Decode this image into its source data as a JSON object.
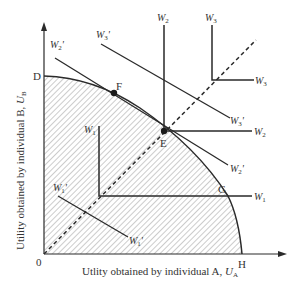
{
  "diagram": {
    "axes": {
      "x_label": "Utlity obtained by individual A, ",
      "x_symbol": "U",
      "x_symbol_sub": "A",
      "y_label": "Utility obtained by individual B, ",
      "y_symbol": "U",
      "y_symbol_sub": "B",
      "origin": "0"
    },
    "points": {
      "D": "D",
      "F": "F",
      "E": "E",
      "G": "G",
      "H": "H"
    },
    "curves": {
      "rawlsian": [
        {
          "id": "W1",
          "label": "W",
          "sub": "1"
        },
        {
          "id": "W2",
          "label": "W",
          "sub": "2"
        },
        {
          "id": "W3",
          "label": "W",
          "sub": "3"
        }
      ],
      "utilitarian": [
        {
          "id": "W1p",
          "label": "W",
          "sub": "1",
          "prime": "'"
        },
        {
          "id": "W2p",
          "label": "W",
          "sub": "2",
          "prime": "'"
        },
        {
          "id": "W3p",
          "label": "W",
          "sub": "3",
          "prime": "'"
        }
      ]
    },
    "colors": {
      "line": "#2a2a2a",
      "hatch": "#9a9a9a",
      "text": "#333333"
    }
  }
}
